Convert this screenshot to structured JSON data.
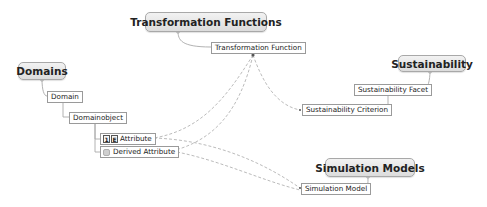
{
  "diagram": {
    "type": "mind-map",
    "central_topics": [
      {
        "id": "domains",
        "label": "Domains"
      },
      {
        "id": "transformation_functions",
        "label": "Transformation Functions"
      },
      {
        "id": "sustainability",
        "label": "Sustainability"
      },
      {
        "id": "simulation_models",
        "label": "Simulation Models"
      }
    ],
    "nodes": {
      "domain": "Domain",
      "domainobject": "Domainobject",
      "attribute": "Attribute",
      "attribute_icon_1": "1",
      "attribute_icon_2": "E",
      "derived_attribute": "Derived Attribute",
      "transformation_function": "Transformation Function",
      "sustainability_facet": "Sustainability Facet",
      "sustainability_criterion": "Sustainability Criterion",
      "simulation_model": "Simulation Model"
    },
    "hierarchy": [
      {
        "parent": "Domains",
        "child": "Domain"
      },
      {
        "parent": "Domain",
        "child": "Domainobject"
      },
      {
        "parent": "Domainobject",
        "child": "Attribute"
      },
      {
        "parent": "Domainobject",
        "child": "Derived Attribute"
      },
      {
        "parent": "Transformation Functions",
        "child": "Transformation Function"
      },
      {
        "parent": "Sustainability",
        "child": "Sustainability Facet"
      },
      {
        "parent": "Sustainability Facet",
        "child": "Sustainability Criterion"
      },
      {
        "parent": "Simulation Models",
        "child": "Simulation Model"
      }
    ],
    "relationships": [
      {
        "from": "Transformation Function",
        "to": "Attribute",
        "style": "dashed"
      },
      {
        "from": "Transformation Function",
        "to": "Derived Attribute",
        "style": "dashed"
      },
      {
        "from": "Transformation Function",
        "to": "Sustainability Criterion",
        "style": "dashed"
      },
      {
        "from": "Attribute",
        "to": "Simulation Model",
        "style": "dashed"
      },
      {
        "from": "Derived Attribute",
        "to": "Simulation Model",
        "style": "dashed"
      }
    ],
    "colors": {
      "topic_fill": "#e6e6e6",
      "topic_border": "#a8a8a8",
      "node_border": "#9a9a9a",
      "line": "#9a9a9a"
    }
  }
}
